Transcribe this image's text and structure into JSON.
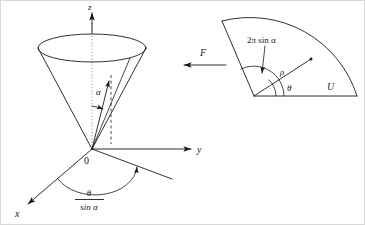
{
  "figure": {
    "caption": "",
    "background_color": "#ffffff",
    "ink_color": "#1a1a1a"
  },
  "left_panel": {
    "name": "cone-in-3d-axes",
    "axes": {
      "z_label": "z",
      "y_label": "y",
      "x_label": "x",
      "origin_label": "0"
    },
    "cone": {
      "apex_label": "0",
      "half_angle_label": "α",
      "axis_style": "dotted"
    },
    "ground_angle": {
      "numerator": "θ",
      "denominator": "sin α"
    }
  },
  "middle": {
    "force_label": "F",
    "arrow_direction": "left"
  },
  "right_panel": {
    "name": "unrolled-cone-sector",
    "arc_angle_label": "2π sin α",
    "radius_label": "ρ",
    "polar_angle_label": "θ",
    "region_label": "U"
  }
}
